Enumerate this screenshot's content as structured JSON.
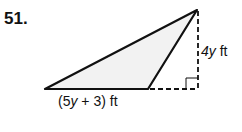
{
  "problem_number": "51.",
  "figure": {
    "type": "obtuse triangle with dashed height",
    "height_label": {
      "var": "4y",
      "unit": " ft"
    },
    "base_label": {
      "open": "(5",
      "var": "y",
      "rest": " + 3) ft"
    },
    "fill_color": "#f2f2f2",
    "stroke_color": "#111111"
  }
}
